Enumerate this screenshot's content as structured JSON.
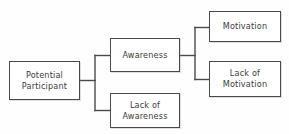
{
  "diagram": {
    "type": "flowchart-tree",
    "orientation": "left-to-right",
    "background_color": "#fefefe",
    "line_color": "#4a4a4a",
    "text_color": "#3a3a3a",
    "nodes": [
      {
        "id": "potential-participant",
        "label": "Potential\nParticipant",
        "level": 0
      },
      {
        "id": "awareness",
        "label": "Awareness",
        "level": 1
      },
      {
        "id": "lack-of-awareness",
        "label": "Lack of\nAwareness",
        "level": 1
      },
      {
        "id": "motivation",
        "label": "Motivation",
        "level": 2
      },
      {
        "id": "lack-of-motivation",
        "label": "Lack of\nMotivation",
        "level": 2
      }
    ],
    "edges": [
      {
        "from": "potential-participant",
        "to": "awareness"
      },
      {
        "from": "potential-participant",
        "to": "lack-of-awareness"
      },
      {
        "from": "awareness",
        "to": "motivation"
      },
      {
        "from": "awareness",
        "to": "lack-of-motivation"
      }
    ]
  }
}
